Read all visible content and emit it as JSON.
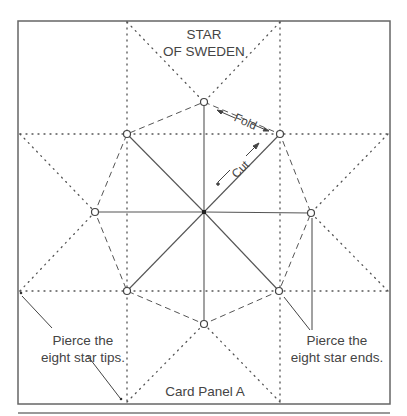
{
  "title": {
    "line1": "STAR",
    "line2": "OF SWEDEN"
  },
  "labels": {
    "fold": "Fold",
    "cut": "Cut",
    "pierce_tips": {
      "line1": "Pierce the",
      "line2": "eight star tips."
    },
    "pierce_ends": {
      "line1": "Pierce the",
      "line2": "eight star ends."
    },
    "panel": "Card Panel A"
  },
  "colors": {
    "line": "#555555",
    "text": "#444444",
    "background": "#ffffff"
  },
  "geometry": {
    "center": [
      204,
      212
    ],
    "star_ends": [
      [
        204,
        102
      ],
      [
        280,
        134
      ],
      [
        311,
        213
      ],
      [
        279,
        291
      ],
      [
        204,
        324
      ],
      [
        127,
        291
      ],
      [
        95,
        212
      ],
      [
        127,
        134
      ]
    ],
    "star_tips": [
      [
        127,
        22
      ],
      [
        280,
        22
      ],
      [
        388,
        134
      ],
      [
        388,
        291
      ],
      [
        280,
        402
      ],
      [
        127,
        402
      ],
      [
        20,
        291
      ],
      [
        20,
        134
      ]
    ]
  }
}
